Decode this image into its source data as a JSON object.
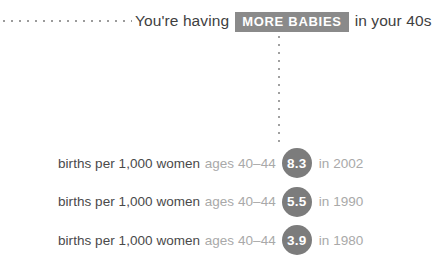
{
  "header": {
    "lead_dots_icon": "horizontal-dotted-line",
    "text_before": "You're having",
    "badge_label": "MORE BABIES",
    "text_after": "in your 40s"
  },
  "connector": {
    "icon": "vertical-dotted-line"
  },
  "rows": [
    {
      "label_main": "births per 1,000 women",
      "label_sub": "ages 40–44",
      "value": "8.3",
      "year_label": "in 2002"
    },
    {
      "label_main": "births per 1,000 women",
      "label_sub": "ages 40–44",
      "value": "5.5",
      "year_label": "in 1990"
    },
    {
      "label_main": "births per 1,000 women",
      "label_sub": "ages 40–44",
      "value": "3.9",
      "year_label": "in 1980"
    }
  ],
  "colors": {
    "badge_background": "#8a8a8a",
    "bubble_background": "#7c7c7c",
    "text_primary": "#4a4a4a",
    "text_secondary": "#a9a9a9",
    "dot_color": "#9b9b9b",
    "page_background": "#ffffff"
  },
  "chart_data": {
    "type": "bar",
    "xlabel": "births per 1,000 women ages 40-44",
    "ylabel": "Year",
    "categories": [
      "2002",
      "1990",
      "1980"
    ],
    "values": [
      8.3,
      5.5,
      3.9
    ],
    "value_labels": [
      "8.3",
      "5.5",
      "3.9"
    ],
    "series": [
      {
        "name": "births per 1,000 women ages 40-44",
        "values": [
          8.3,
          5.5,
          3.9
        ]
      }
    ],
    "annotations": [
      "births per 1,000 women ages 40-44  8.3  in 2002",
      "births per 1,000 women ages 40-44  5.5  in 1990",
      "births per 1,000 women ages 40-44  3.9  in 1980"
    ],
    "grid": false,
    "legend": "none"
  }
}
